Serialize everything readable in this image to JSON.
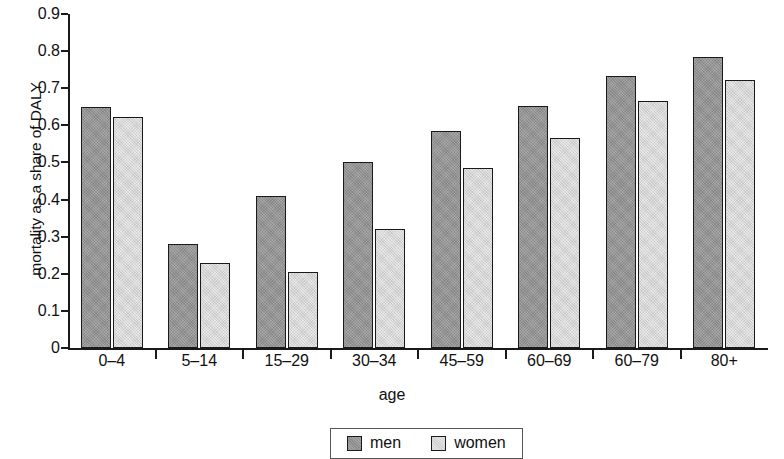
{
  "chart_data": {
    "type": "bar",
    "title": "",
    "xlabel": "age",
    "ylabel": "mortality as a share of DALY",
    "categories": [
      "0–4",
      "5–14",
      "15–29",
      "30–34",
      "45–59",
      "60–69",
      "60–79",
      "80+"
    ],
    "series": [
      {
        "name": "men",
        "color": "#969696",
        "values": [
          0.65,
          0.28,
          0.41,
          0.5,
          0.585,
          0.653,
          0.733,
          0.785
        ]
      },
      {
        "name": "women",
        "color": "#dcdcdc",
        "values": [
          0.623,
          0.229,
          0.205,
          0.322,
          0.485,
          0.566,
          0.665,
          0.722
        ]
      }
    ],
    "ylim": [
      0,
      0.9
    ],
    "ytick_labels": [
      "0.9",
      "0.8",
      "0.7",
      "0.6",
      "0.5",
      "0.4",
      "0.3",
      "0.2",
      "0.1",
      "0"
    ],
    "ytick_values": [
      0.9,
      0.8,
      0.7,
      0.6,
      0.5,
      0.4,
      0.3,
      0.2,
      0.1,
      0
    ],
    "grid": false,
    "legend_position": "bottom-center"
  },
  "legend": {
    "entries": [
      {
        "label": "men"
      },
      {
        "label": "women"
      }
    ]
  },
  "axes": {
    "x_title": "age",
    "y_title": "mortality as a share of DALY"
  }
}
